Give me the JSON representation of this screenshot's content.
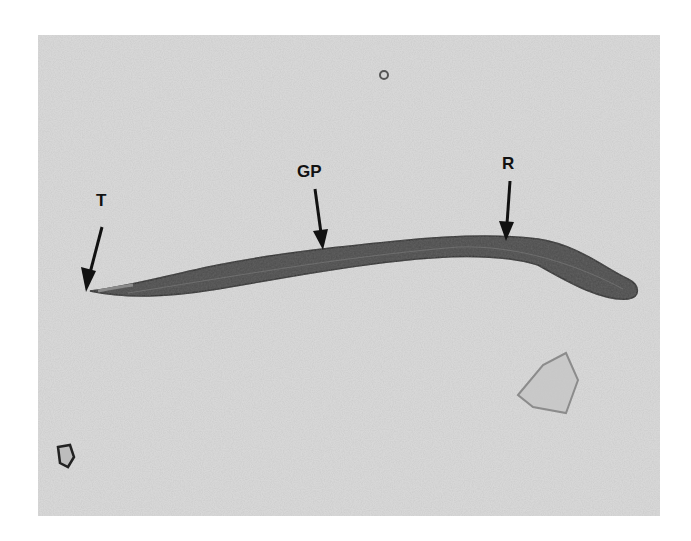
{
  "figure": {
    "background_color": "#dcdcdc",
    "worm_color": "#4a4a4a",
    "annotation_color": "#111111",
    "labels": [
      {
        "id": "T",
        "text": "T",
        "x": 100,
        "y": 197
      },
      {
        "id": "GP",
        "text": "GP",
        "x": 297,
        "y": 163
      },
      {
        "id": "R",
        "text": "R",
        "x": 502,
        "y": 156
      }
    ]
  }
}
